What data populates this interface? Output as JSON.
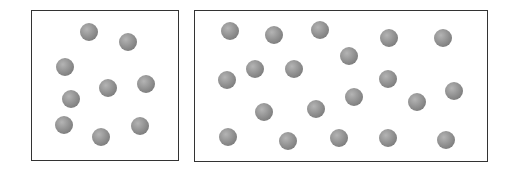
{
  "containers": [
    {
      "id": "left-container",
      "box": {
        "x": 31,
        "y": 10,
        "w": 148,
        "h": 151
      },
      "particle_count": 9,
      "particles": [
        [
          89,
          32
        ],
        [
          128,
          42
        ],
        [
          65,
          67
        ],
        [
          108,
          88
        ],
        [
          146,
          84
        ],
        [
          71,
          99
        ],
        [
          64,
          125
        ],
        [
          101,
          137
        ],
        [
          140,
          126
        ]
      ]
    },
    {
      "id": "right-container",
      "box": {
        "x": 194,
        "y": 10,
        "w": 294,
        "h": 152
      },
      "particle_count": 20,
      "particles": [
        [
          230,
          31
        ],
        [
          274,
          35
        ],
        [
          320,
          30
        ],
        [
          389,
          38
        ],
        [
          443,
          38
        ],
        [
          349,
          56
        ],
        [
          227,
          80
        ],
        [
          255,
          69
        ],
        [
          294,
          69
        ],
        [
          388,
          79
        ],
        [
          454,
          91
        ],
        [
          354,
          97
        ],
        [
          417,
          102
        ],
        [
          264,
          112
        ],
        [
          316,
          109
        ],
        [
          228,
          137
        ],
        [
          288,
          141
        ],
        [
          339,
          138
        ],
        [
          388,
          138
        ],
        [
          446,
          140
        ]
      ]
    }
  ],
  "colors": {
    "border": "#333333",
    "particle": "#8a8a8a",
    "background": "#ffffff"
  }
}
